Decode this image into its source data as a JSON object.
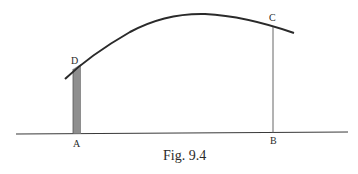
{
  "figure": {
    "caption": "Fig. 9.4",
    "labels": {
      "A": "A",
      "B": "B",
      "C": "C",
      "D": "D"
    },
    "colors": {
      "ink": "#2a2a2a",
      "strip_fill": "#7a7a7a",
      "background": "#ffffff"
    }
  }
}
